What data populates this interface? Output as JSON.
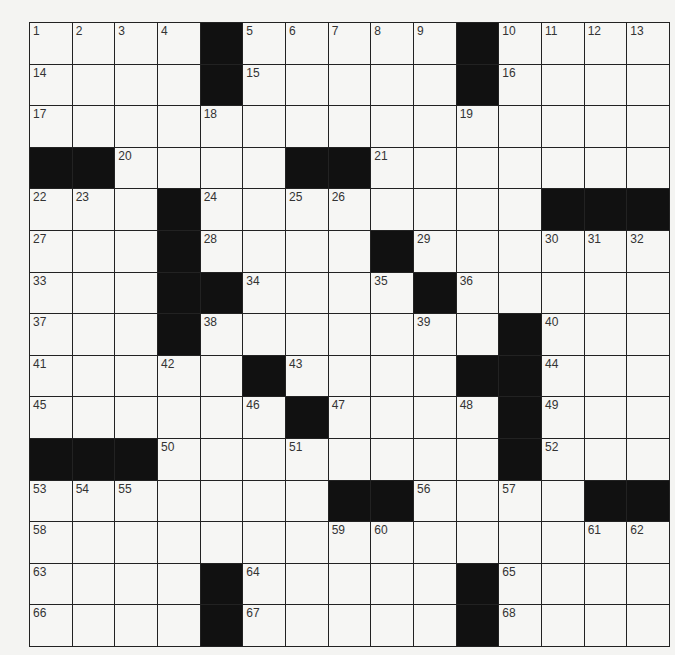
{
  "puzzle": {
    "rows": 15,
    "cols": 15,
    "layout": [
      "....#.....#....",
      "....#.....#....",
      "...............",
      "##....##.......",
      "...#........###",
      "...#....#......",
      "...##....#.....",
      "...#.......#...",
      ".....#....##...",
      "......#....#...",
      "###........#...",
      ".......##....##",
      "...............",
      "....#.....#....",
      "....#.....#...."
    ],
    "colors": {
      "block": "#111111",
      "cell": "#f6f6f4",
      "line": "#222222",
      "number": "#333333"
    }
  }
}
